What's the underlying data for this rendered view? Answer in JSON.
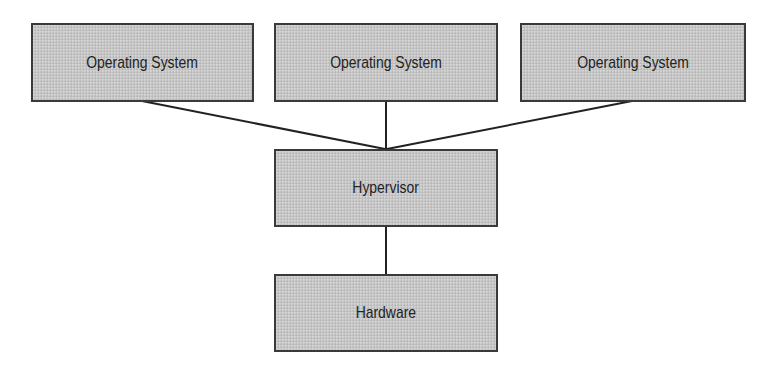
{
  "diagram": {
    "title": "",
    "colors": {
      "node_fill": "#c6c6c6",
      "node_border": "#3a3a3a",
      "connector": "#222222",
      "text": "#222222",
      "background": "#ffffff"
    },
    "nodes": {
      "os1": {
        "label": "Operating System",
        "x": 31,
        "y": 23,
        "w": 223,
        "h": 79
      },
      "os2": {
        "label": "Operating System",
        "x": 274,
        "y": 23,
        "w": 224,
        "h": 79
      },
      "os3": {
        "label": "Operating System",
        "x": 520,
        "y": 23,
        "w": 226,
        "h": 79
      },
      "hypervisor": {
        "label": "Hypervisor",
        "x": 274,
        "y": 149,
        "w": 224,
        "h": 78
      },
      "hardware": {
        "label": "Hardware",
        "x": 274,
        "y": 274,
        "w": 224,
        "h": 78
      }
    },
    "edges": [
      {
        "from": "os1",
        "to": "hypervisor"
      },
      {
        "from": "os2",
        "to": "hypervisor"
      },
      {
        "from": "os3",
        "to": "hypervisor"
      },
      {
        "from": "hypervisor",
        "to": "hardware"
      }
    ]
  }
}
